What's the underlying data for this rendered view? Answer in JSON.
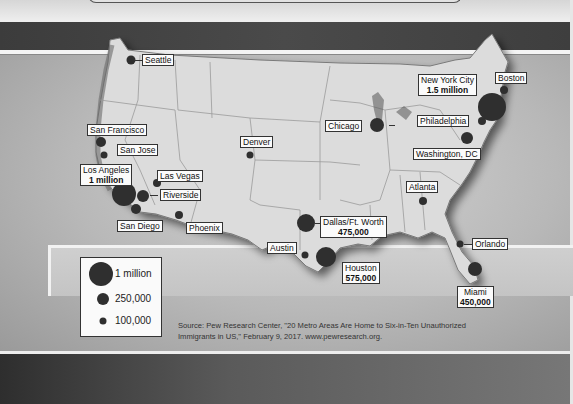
{
  "map": {
    "title": "Metro areas with unauthorized immigrant populations",
    "colors": {
      "land": "#d9d9d9",
      "dot": "#2f2f2f",
      "dark_band": "#444444"
    },
    "cities": [
      {
        "name": "Seattle",
        "value": ""
      },
      {
        "name": "San Francisco",
        "value": ""
      },
      {
        "name": "San Jose",
        "value": ""
      },
      {
        "name": "Los Angeles",
        "value": "1 million"
      },
      {
        "name": "Las Vegas",
        "value": ""
      },
      {
        "name": "Riverside",
        "value": ""
      },
      {
        "name": "San Diego",
        "value": ""
      },
      {
        "name": "Phoenix",
        "value": ""
      },
      {
        "name": "Denver",
        "value": ""
      },
      {
        "name": "Chicago",
        "value": ""
      },
      {
        "name": "New York City",
        "value": "1.5 million"
      },
      {
        "name": "Boston",
        "value": ""
      },
      {
        "name": "Philadelphia",
        "value": ""
      },
      {
        "name": "Washington, DC",
        "value": ""
      },
      {
        "name": "Atlanta",
        "value": ""
      },
      {
        "name": "Dallas/Ft. Worth",
        "value": "475,000"
      },
      {
        "name": "Austin",
        "value": ""
      },
      {
        "name": "Houston",
        "value": "575,000"
      },
      {
        "name": "Orlando",
        "value": ""
      },
      {
        "name": "Miami",
        "value": "450,000"
      }
    ]
  },
  "legend": {
    "items": [
      {
        "label": "1 million"
      },
      {
        "label": "250,000"
      },
      {
        "label": "100,000"
      }
    ]
  },
  "source": {
    "line1": "Source: Pew Research Center, \"20 Metro Areas Are Home to Six-in-Ten Unauthorized",
    "line2": "Immigrants in US,\" February 9, 2017. www.pewresearch.org."
  }
}
